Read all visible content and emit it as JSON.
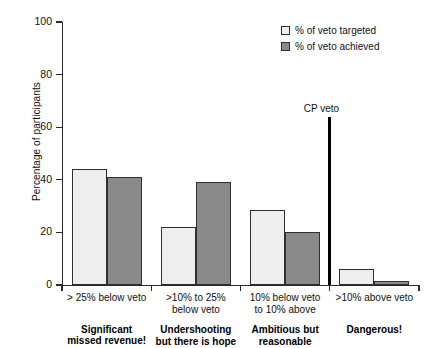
{
  "chart_data": {
    "type": "bar",
    "title": "",
    "xlabel": "",
    "ylabel": "Percentage of participants",
    "ylim": [
      0,
      100
    ],
    "yticks": [
      0,
      20,
      40,
      60,
      80,
      100
    ],
    "grid": false,
    "legend_position": "top-right",
    "categories": [
      "> 25% below veto",
      ">10%  to 25% below veto",
      "10% below veto to 10% above",
      ">10% above veto"
    ],
    "category_lines": [
      [
        "> 25% below veto"
      ],
      [
        ">10%  to 25%",
        "below veto"
      ],
      [
        "10% below veto",
        "to 10% above"
      ],
      [
        ">10% above veto"
      ]
    ],
    "category_verdicts": [
      [
        "Significant",
        "missed revenue!"
      ],
      [
        "Undershooting",
        "but there is hope"
      ],
      [
        "Ambitious but",
        "reasonable"
      ],
      [
        "Dangerous!"
      ]
    ],
    "series": [
      {
        "name": "% of veto targeted",
        "color": "#eeeeee",
        "values": [
          44,
          22,
          28.5,
          6
        ]
      },
      {
        "name": "% of veto achieved",
        "color": "#8a8a8a",
        "values": [
          41,
          39,
          20,
          1.5
        ]
      }
    ],
    "annotations": [
      {
        "label": "CP veto",
        "between_categories": [
          3,
          4
        ],
        "color": "#000000"
      }
    ]
  },
  "legend": {
    "items": [
      {
        "label": "% of veto targeted"
      },
      {
        "label": "% of veto achieved"
      }
    ]
  },
  "axis": {
    "y_title": "Percentage of participants",
    "y_tick_labels": [
      "0",
      "20",
      "40",
      "60",
      "80",
      "100"
    ]
  }
}
